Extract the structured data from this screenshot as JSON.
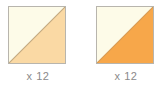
{
  "diagram": {
    "background_color": "#ffffff",
    "units": [
      {
        "id": "half-square-triangle-light",
        "quantity_label": "x 12",
        "swatch": {
          "border_color": "#b8b5ad",
          "diagonal_line_color": "#c2a87e",
          "upper_triangle_color": "#fdfbe8",
          "lower_triangle_color": "#fad9a4"
        }
      },
      {
        "id": "half-square-triangle-orange",
        "quantity_label": "x 12",
        "swatch": {
          "border_color": "#b8b5ad",
          "diagonal_line_color": "#d79a53",
          "upper_triangle_color": "#fdfbe8",
          "lower_triangle_color": "#f7a74a"
        }
      }
    ]
  }
}
